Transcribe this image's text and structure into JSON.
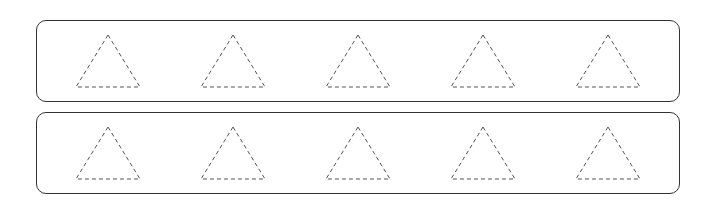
{
  "rows": [
    {
      "name": "row-1",
      "top": 20,
      "shapes": [
        "triangle",
        "triangle",
        "triangle",
        "triangle",
        "triangle"
      ]
    },
    {
      "name": "row-2",
      "top": 112,
      "shapes": [
        "triangle",
        "triangle",
        "triangle",
        "triangle",
        "triangle"
      ]
    }
  ],
  "shape_style": {
    "stroke": "#555555",
    "dash": "4,3",
    "fill": "none"
  },
  "triangle_centers_x": [
    108,
    233,
    358,
    483,
    608
  ]
}
